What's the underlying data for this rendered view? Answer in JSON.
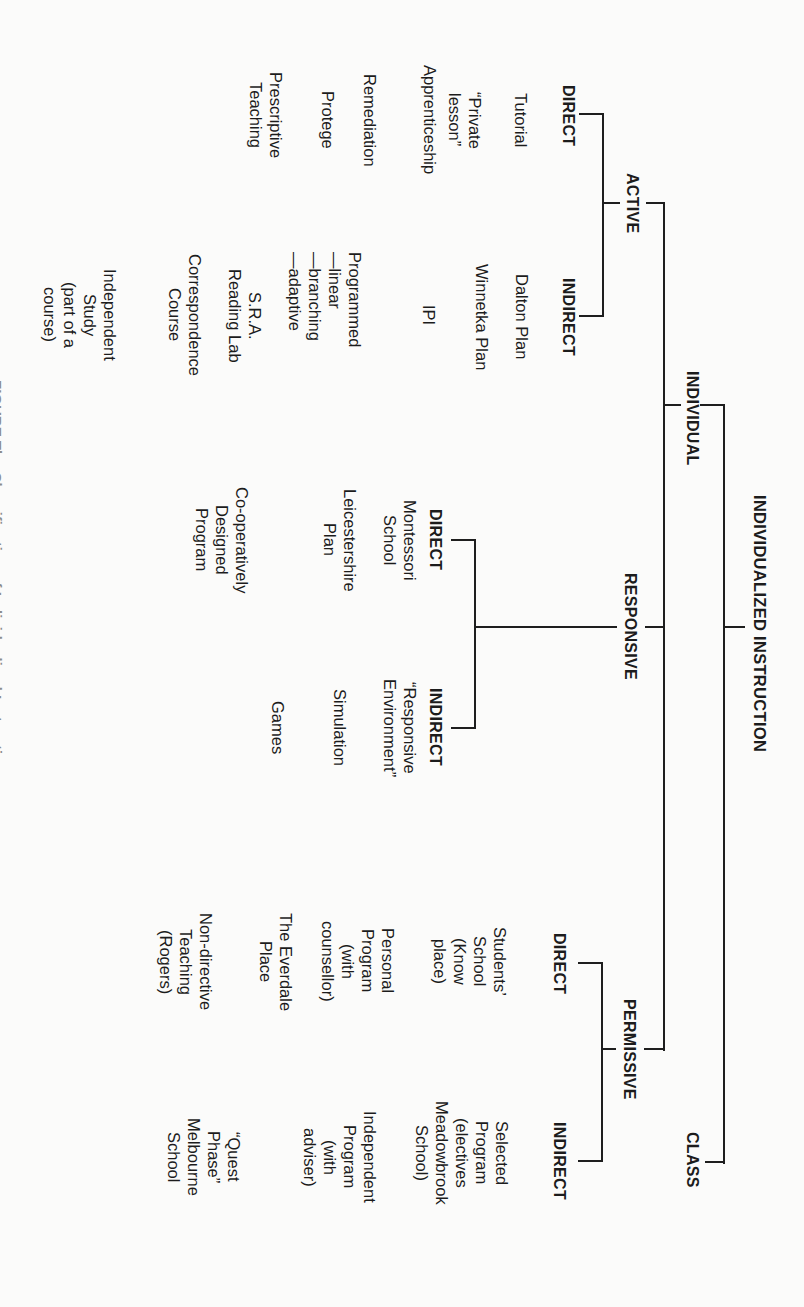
{
  "diagram": {
    "orientation": "rotated-90-clockwise",
    "root": {
      "label": "INDIVIDUALIZED INSTRUCTION"
    },
    "level1": [
      {
        "label": "INDIVIDUAL"
      },
      {
        "label": "CLASS"
      }
    ],
    "modes": [
      {
        "label": "ACTIVE",
        "direct": {
          "label": "DIRECT",
          "items": [
            "Tutorial",
            "“Private\nlesson”",
            "Apprenticeship",
            "Remediation",
            "Protege",
            "Prescriptive\nTeaching"
          ]
        },
        "indirect": {
          "label": "INDIRECT",
          "items": [
            "Dalton Plan",
            "Winnetka Plan",
            "IPI",
            "Programmed\n—linear\n—branching\n—adaptive",
            "S.R.A.\nReading Lab",
            "Correspondence\nCourse",
            "Independent\nStudy\n(part of a\ncourse)"
          ]
        }
      },
      {
        "label": "RESPONSIVE",
        "direct": {
          "label": "DIRECT",
          "items": [
            "Montessori\nSchool",
            "Leicestershire\nPlan",
            "Co-operatively\nDesigned\nProgram"
          ]
        },
        "indirect": {
          "label": "INDIRECT",
          "items": [
            "“Responsive\nEnvironment”",
            "Simulation",
            "Games"
          ]
        }
      },
      {
        "label": "PERMISSIVE",
        "direct": {
          "label": "DIRECT",
          "items": [
            "Students’\nSchool\n(Know\nplace)",
            "Personal\nProgram\n(with\ncounsellor)",
            "The Everdale\nPlace",
            "Non-directive\nTeaching\n(Rogers)"
          ]
        },
        "indirect": {
          "label": "INDIRECT",
          "items": [
            "Selected\nProgram\n(electives\nMeadowbrook\nSchool)",
            "Independent\nProgram\n(with\nadviser)",
            "“Quest\nPhase”\nMelbourne\nSchool"
          ]
        }
      }
    ]
  },
  "caption": {
    "text": "FIGURE   The   Classification of Individualized Instruction"
  },
  "colors": {
    "background": "#fbfbfa",
    "ink": "#1e1e1e"
  }
}
